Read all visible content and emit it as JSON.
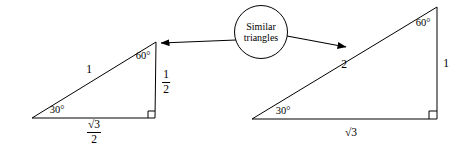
{
  "figure": {
    "background_color": "#ffffff",
    "stroke_color": "#000000",
    "width": 464,
    "height": 146
  },
  "callout": {
    "line1": "Similar",
    "line2": "triangles",
    "shape": "circle",
    "center_x": 261,
    "center_y": 32,
    "radius": 27
  },
  "arrows": {
    "left": {
      "name": "arrow-to-small-triangle",
      "from_x": 236,
      "from_y": 40,
      "to_x": 160,
      "to_y": 43
    },
    "right": {
      "name": "arrow-to-large-triangle",
      "from_x": 287,
      "from_y": 36,
      "to_x": 347,
      "to_y": 47
    }
  },
  "triangles": [
    {
      "name": "small-triangle",
      "vertices": {
        "bottom_left": {
          "x": 32,
          "y": 118
        },
        "bottom_right": {
          "x": 155,
          "y": 118
        },
        "apex": {
          "x": 156,
          "y": 42
        }
      },
      "labels": {
        "angle_bottom_left": "30°",
        "angle_apex": "60°",
        "hypotenuse": "1",
        "vertical_side_numerator": "1",
        "vertical_side_denominator": "2",
        "base_numerator": "√3",
        "base_denominator": "2"
      },
      "label_positions": {
        "angle_bottom_left": {
          "x": 57,
          "y": 110
        },
        "angle_apex": {
          "x": 143,
          "y": 56
        },
        "hypotenuse": {
          "x": 89,
          "y": 70
        },
        "vertical_side": {
          "x": 166,
          "y": 82
        },
        "base": {
          "x": 94,
          "y": 132
        }
      },
      "right_angle_marker": {
        "x": 155,
        "y": 118,
        "size": 7
      }
    },
    {
      "name": "large-triangle",
      "vertices": {
        "bottom_left": {
          "x": 252,
          "y": 119
        },
        "bottom_right": {
          "x": 437,
          "y": 119
        },
        "apex": {
          "x": 437,
          "y": 7
        }
      },
      "labels": {
        "angle_bottom_left": "30°",
        "angle_apex": "60°",
        "hypotenuse": "2",
        "vertical_side": "1",
        "base": "√3"
      },
      "label_positions": {
        "angle_bottom_left": {
          "x": 283,
          "y": 111
        },
        "angle_apex": {
          "x": 423,
          "y": 23
        },
        "hypotenuse": {
          "x": 344,
          "y": 65
        },
        "vertical_side": {
          "x": 446,
          "y": 64
        },
        "base": {
          "x": 351,
          "y": 133
        }
      },
      "right_angle_marker": {
        "x": 437,
        "y": 119,
        "size": 8
      }
    }
  ]
}
